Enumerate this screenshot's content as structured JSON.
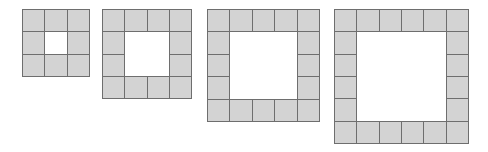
{
  "diagram": {
    "title": "",
    "colors": {
      "tile_fill": "#d3d3d3",
      "tile_border": "#6e6e6e",
      "background": "#ffffff"
    },
    "figures": [
      {
        "id": "figure-1",
        "grid_size": 3,
        "tile_count": 8,
        "x": 22,
        "y": 9,
        "size": 67
      },
      {
        "id": "figure-2",
        "grid_size": 4,
        "tile_count": 12,
        "x": 102,
        "y": 9,
        "size": 89
      },
      {
        "id": "figure-3",
        "grid_size": 5,
        "tile_count": 16,
        "x": 207,
        "y": 9,
        "size": 112
      },
      {
        "id": "figure-4",
        "grid_size": 6,
        "tile_count": 20,
        "x": 334,
        "y": 9,
        "size": 134
      }
    ]
  }
}
